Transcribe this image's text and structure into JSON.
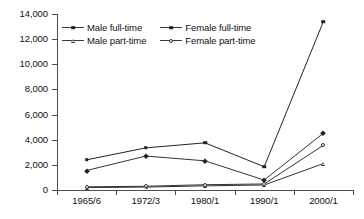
{
  "chart_data": {
    "type": "line",
    "title": "",
    "xlabel": "",
    "ylabel": "",
    "categories": [
      "1965/6",
      "1972/3",
      "1980/1",
      "1990/1",
      "2000/1"
    ],
    "ylim": [
      0,
      14000
    ],
    "yticks": [
      0,
      2000,
      4000,
      6000,
      8000,
      10000,
      12000,
      14000
    ],
    "ytick_labels": [
      "0",
      "2,000",
      "4,000",
      "6,000",
      "8,000",
      "10,000",
      "12,000",
      "14,000"
    ],
    "grid": false,
    "legend_position": "top-left-inside",
    "series": [
      {
        "name": "Male full-time",
        "marker": "diamond-filled",
        "color": "#333333",
        "values": [
          1550,
          2700,
          2320,
          790,
          4520
        ]
      },
      {
        "name": "Female full-time",
        "marker": "square-filled",
        "color": "#222222",
        "values": [
          2400,
          3350,
          3750,
          1850,
          13400
        ]
      },
      {
        "name": "Male part-time",
        "marker": "triangle-open",
        "color": "#333333",
        "values": [
          190,
          230,
          330,
          400,
          2100
        ]
      },
      {
        "name": "Female part-time",
        "marker": "circle-open",
        "color": "#333333",
        "values": [
          250,
          300,
          420,
          480,
          3560
        ]
      }
    ]
  },
  "legend": {
    "items": [
      {
        "label": "Male full-time",
        "marker": "diamond-filled"
      },
      {
        "label": "Female full-time",
        "marker": "square-filled"
      },
      {
        "label": "Male part-time",
        "marker": "triangle-open"
      },
      {
        "label": "Female part-time",
        "marker": "circle-open"
      }
    ]
  },
  "colors": {
    "axis": "#4d4d4d",
    "line": "#3b3b3b",
    "text": "#111111",
    "background": "#ffffff"
  }
}
